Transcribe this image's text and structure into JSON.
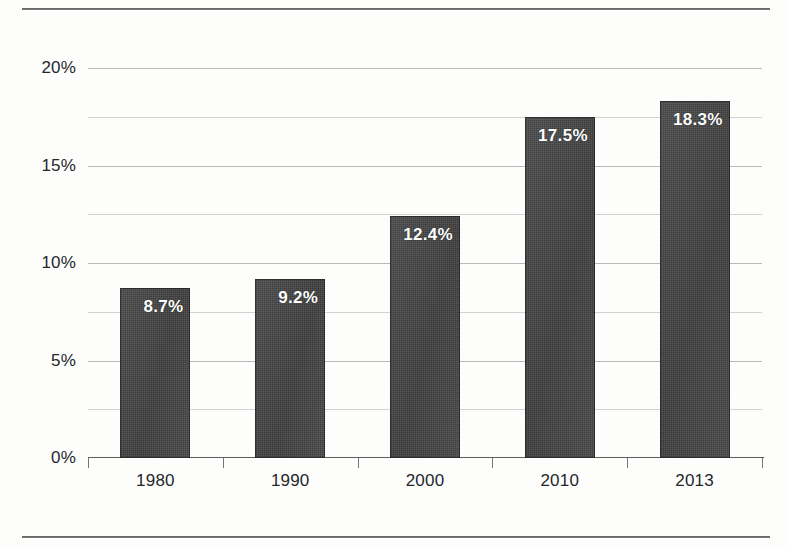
{
  "chart_data": {
    "type": "bar",
    "title": "",
    "subtitle": "",
    "xlabel": "",
    "ylabel": "",
    "categories": [
      "1980",
      "1990",
      "2000",
      "2010",
      "2013"
    ],
    "values": [
      8.7,
      9.2,
      12.4,
      17.5,
      18.3
    ],
    "data_labels": [
      "8.7%",
      "9.2%",
      "12.4%",
      "17.5%",
      "18.3%"
    ],
    "ylim": [
      0,
      20
    ],
    "y_major_ticks": [
      0,
      5,
      10,
      15,
      20
    ],
    "y_tick_labels": [
      "0%",
      "5%",
      "10%",
      "15%",
      "20%"
    ],
    "y_minor_ticks": [
      2.5,
      7.5,
      12.5,
      17.5
    ],
    "grid": true,
    "legend": null,
    "legend_position": "none",
    "series": [
      {
        "name": "",
        "values": [
          8.7,
          9.2,
          12.4,
          17.5,
          18.3
        ]
      }
    ],
    "colors": {
      "bar_fill": "#3b3b3b",
      "data_label": "#ffffff",
      "gridline_major": "#b9b9b9",
      "gridline_minor": "#d2d2d2",
      "axis_line": "#5d5d5d",
      "tick_label": "#25272b",
      "background": "#fdfdfc",
      "rule": "#4a4a4a"
    }
  },
  "decorations": {
    "top_rule": "",
    "bottom_rule": ""
  }
}
